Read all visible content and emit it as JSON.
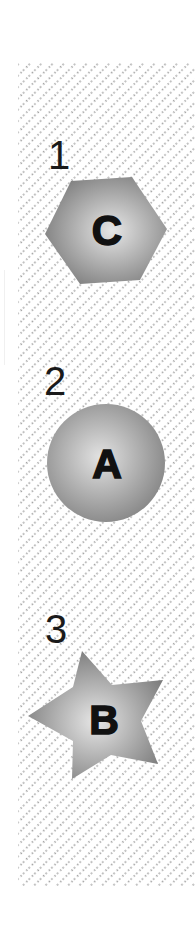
{
  "figure": {
    "background_pattern": "diagonal-dotted-hatch",
    "colors": {
      "pattern_dot": "#8a8a8a",
      "shape_light": "#e6e6e6",
      "shape_dark": "#7d7d7d",
      "letter": "#111111",
      "number": "#1a1a1a"
    }
  },
  "items": [
    {
      "number": "1",
      "shape": "hexagon",
      "letter": "C"
    },
    {
      "number": "2",
      "shape": "circle",
      "letter": "A"
    },
    {
      "number": "3",
      "shape": "star",
      "letter": "B"
    }
  ]
}
